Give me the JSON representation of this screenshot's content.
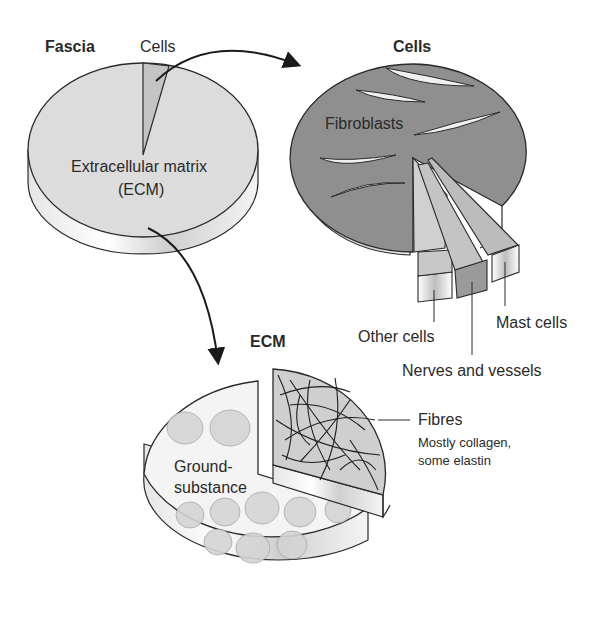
{
  "figure": {
    "fascia_pie": {
      "title": "Fascia",
      "cells_label": "Cells",
      "ecm_label_line1": "Extracellular matrix",
      "ecm_label_line2": "(ECM)"
    },
    "cells_pie": {
      "title": "Cells",
      "fibroblasts_label": "Fibroblasts",
      "other_cells_label": "Other cells",
      "nerves_vessels_label": "Nerves and vessels",
      "mast_cells_label": "Mast cells"
    },
    "ecm_pie": {
      "title": "ECM",
      "ground_substance_line1": "Ground-",
      "ground_substance_line2": "substance",
      "fibres_label": "Fibres",
      "fibres_desc_line1": "Mostly collagen,",
      "fibres_desc_line2": "some elastin"
    }
  },
  "colors": {
    "fascia_top": "#dcdcdc",
    "fascia_side": "#efefef",
    "cells_top": "#8f8f8f",
    "cells_slice": "#c8c8c8",
    "ecm_top": "#f2f2f2",
    "fibres_top": "#cfcfcf",
    "outline": "#2a2a2a"
  }
}
